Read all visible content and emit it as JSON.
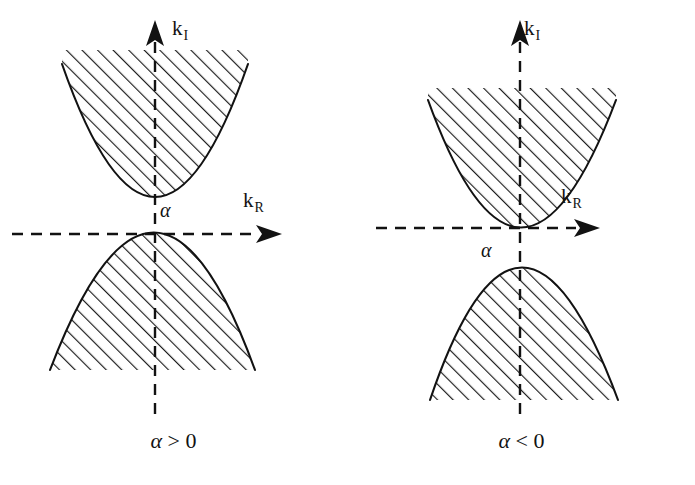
{
  "figure": {
    "background_color": "#ffffff",
    "stroke_color": "#121212",
    "hatch_color": "#1a1a1a",
    "panel_count": 2
  },
  "panels": [
    {
      "id": "left",
      "caption": "α > 0",
      "caption_symbol": "α",
      "caption_relation": "> 0",
      "alpha_label": "α",
      "axes": {
        "vertical_label_base": "k",
        "vertical_label_sub": "I",
        "horizontal_label_base": "k",
        "horizontal_label_sub": "R",
        "vertical_style": "dashed",
        "horizontal_style": "dashed",
        "vertical_arrow": "up",
        "horizontal_arrow": "right",
        "origin_x": 155,
        "origin_y": 234
      },
      "regions": [
        {
          "name": "upper-branch-region",
          "orientation": "opens-up",
          "vertex_offset_from_origin": "+alpha (above axis)",
          "vertex_x": 155,
          "vertex_y": 198,
          "top_y": 64,
          "left_x": 62,
          "right_x": 248,
          "hatched": true,
          "hatch_angle_deg": 45
        },
        {
          "name": "lower-branch-region",
          "orientation": "opens-down",
          "vertex_offset_from_origin": "0 (on axis)",
          "vertex_x": 155,
          "vertex_y": 234,
          "bottom_y": 370,
          "left_x": 50,
          "right_x": 255,
          "hatched": true,
          "hatch_angle_deg": 45
        }
      ]
    },
    {
      "id": "right",
      "caption": "α < 0",
      "caption_symbol": "α",
      "caption_relation": "< 0",
      "alpha_label": "α",
      "axes": {
        "vertical_label_base": "k",
        "vertical_label_sub": "I",
        "horizontal_label_base": "k",
        "horizontal_label_sub": "R",
        "vertical_style": "dashed",
        "horizontal_style": "dashed",
        "vertical_arrow": "up",
        "horizontal_arrow": "right",
        "origin_x": 172,
        "origin_y": 228
      },
      "regions": [
        {
          "name": "upper-branch-region",
          "orientation": "opens-up",
          "vertex_offset_from_origin": "0 (on axis)",
          "vertex_x": 172,
          "vertex_y": 228,
          "top_y": 100,
          "left_x": 80,
          "right_x": 268,
          "hatched": true,
          "hatch_angle_deg": 45
        },
        {
          "name": "lower-branch-region",
          "orientation": "opens-down",
          "vertex_offset_from_origin": "-alpha (below axis)",
          "vertex_x": 172,
          "vertex_y": 275,
          "bottom_y": 400,
          "left_x": 82,
          "right_x": 270,
          "hatched": true,
          "hatch_angle_deg": 45
        }
      ]
    }
  ]
}
